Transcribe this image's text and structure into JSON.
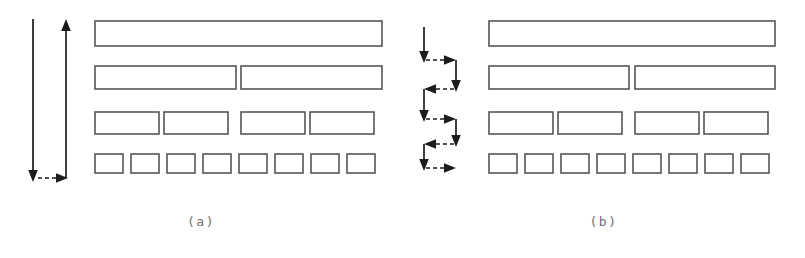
{
  "figure": {
    "background_color": "#ffffff",
    "block_stroke_color": "#555555",
    "arrow_color": "#1c1c1c",
    "caption_color": "#6f6f6f",
    "width": 805,
    "height": 258
  },
  "panels": [
    {
      "id": "a",
      "caption": "(a)",
      "traversal_name": "vertical down-then-up pass",
      "arrow_legend": {
        "down_arrow": "downward pass across all levels",
        "up_arrow": "upward pass across all levels",
        "dashed_link": "turn-around link at bottom level"
      },
      "levels": [
        {
          "level": 1,
          "block_count": 1,
          "block_width": 287,
          "block_height": 25,
          "y": 21,
          "blocks": [
            {
              "x": 95,
              "width": 287
            }
          ]
        },
        {
          "level": 2,
          "block_count": 2,
          "block_width": 141,
          "block_height": 23,
          "y": 66,
          "blocks": [
            {
              "x": 95,
              "width": 141
            },
            {
              "x": 241,
              "width": 141
            }
          ]
        },
        {
          "level": 3,
          "block_count": 4,
          "block_width": 64,
          "block_height": 22,
          "y": 112,
          "blocks": [
            {
              "x": 95,
              "width": 64
            },
            {
              "x": 164,
              "width": 64
            },
            {
              "x": 241,
              "width": 64
            },
            {
              "x": 310,
              "width": 64
            }
          ]
        },
        {
          "level": 4,
          "block_count": 8,
          "block_width": 28,
          "block_height": 19,
          "y": 154,
          "blocks": [
            {
              "x": 95,
              "width": 28
            },
            {
              "x": 131,
              "width": 28
            },
            {
              "x": 167,
              "width": 28
            },
            {
              "x": 203,
              "width": 28
            },
            {
              "x": 239,
              "width": 28
            },
            {
              "x": 275,
              "width": 28
            },
            {
              "x": 311,
              "width": 28
            },
            {
              "x": 347,
              "width": 28
            }
          ]
        }
      ]
    },
    {
      "id": "b",
      "caption": "(b)",
      "traversal_name": "serpentine zig-zag level traversal",
      "arrow_legend": {
        "down_arrow": "descend one level",
        "dashed_link": "lateral hand-off between columns"
      },
      "levels": [
        {
          "level": 1,
          "block_count": 1,
          "block_width": 286,
          "block_height": 25,
          "y": 21,
          "blocks": [
            {
              "x": 489,
              "width": 286
            }
          ]
        },
        {
          "level": 2,
          "block_count": 2,
          "block_width": 140,
          "block_height": 23,
          "y": 66,
          "blocks": [
            {
              "x": 489,
              "width": 140
            },
            {
              "x": 635,
              "width": 140
            }
          ]
        },
        {
          "level": 3,
          "block_count": 4,
          "block_width": 64,
          "block_height": 22,
          "y": 112,
          "blocks": [
            {
              "x": 489,
              "width": 64
            },
            {
              "x": 558,
              "width": 64
            },
            {
              "x": 635,
              "width": 64
            },
            {
              "x": 704,
              "width": 64
            }
          ]
        },
        {
          "level": 4,
          "block_count": 8,
          "block_width": 28,
          "block_height": 19,
          "y": 154,
          "blocks": [
            {
              "x": 489,
              "width": 28
            },
            {
              "x": 525,
              "width": 28
            },
            {
              "x": 561,
              "width": 28
            },
            {
              "x": 597,
              "width": 28
            },
            {
              "x": 633,
              "width": 28
            },
            {
              "x": 669,
              "width": 28
            },
            {
              "x": 705,
              "width": 28
            },
            {
              "x": 741,
              "width": 28
            }
          ]
        }
      ]
    }
  ]
}
